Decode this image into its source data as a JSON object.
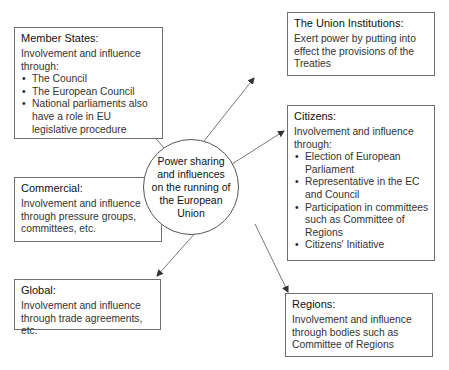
{
  "center": {
    "label": "Power sharing and influences on the running of the European Union"
  },
  "nodes": {
    "member_states": {
      "title": "Member States:",
      "intro": "Involvement and influence through:",
      "bullets": [
        "The Council",
        "The European Council",
        "National parliaments also have a role in EU legislative procedure"
      ]
    },
    "union_institutions": {
      "title": "The Union Institutions:",
      "text": "Exert power by putting into effect the provisions of the Treaties"
    },
    "citizens": {
      "title": "Citizens:",
      "intro": "Involvement and influence through:",
      "bullets": [
        "Election of European Parliament",
        "Representative in the EC and Council",
        "Participation in committees such as Committee of Regions",
        "Citizens' Initiative"
      ]
    },
    "commercial": {
      "title": "Commercial:",
      "text": "Involvement and influence through pressure groups, committees, etc."
    },
    "global": {
      "title": "Global:",
      "text": "Involvement and influence through trade agreements, etc."
    },
    "regions": {
      "title": "Regions:",
      "text": "Involvement and influence through bodies such as Committee of Regions"
    }
  },
  "colors": {
    "border": "#6f6f6f",
    "line": "#444444",
    "text": "#222222",
    "background": "#ffffff"
  }
}
